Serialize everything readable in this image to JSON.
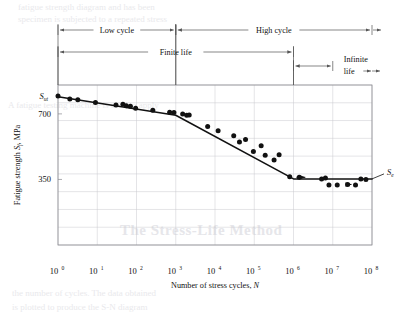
{
  "figure": {
    "caption_symbols": {
      "ultimate_strength": "S",
      "ultimate_strength_sub": "ut",
      "endurance_limit": "S",
      "endurance_limit_sub": "e"
    },
    "axes": {
      "x": {
        "label_text": "Number of stress cycles, ",
        "label_italic": "N",
        "ticks": [
          {
            "mantissa": "10",
            "exponent": "0",
            "value": 1
          },
          {
            "mantissa": "10",
            "exponent": "1",
            "value": 10
          },
          {
            "mantissa": "10",
            "exponent": "2",
            "value": 100
          },
          {
            "mantissa": "10",
            "exponent": "3",
            "value": 1000
          },
          {
            "mantissa": "10",
            "exponent": "4",
            "value": 10000
          },
          {
            "mantissa": "10",
            "exponent": "5",
            "value": 100000
          },
          {
            "mantissa": "10",
            "exponent": "6",
            "value": 1000000
          },
          {
            "mantissa": "10",
            "exponent": "7",
            "value": 10000000
          },
          {
            "mantissa": "10",
            "exponent": "8",
            "value": 100000000
          }
        ],
        "range_log10": [
          0,
          8
        ],
        "scale": "log"
      },
      "y": {
        "label_pre": "Fatigue strength ",
        "label_italic": "S",
        "label_sub": "f",
        "label_post": ", MPa",
        "ticks": [
          {
            "label": "700",
            "value": 700
          },
          {
            "label": "350",
            "value": 350
          }
        ],
        "range": [
          175,
          950
        ],
        "unit": "MPa",
        "scale": "log"
      }
    },
    "annotations": [
      {
        "name": "low-cycle",
        "label": "Low cycle",
        "from_log10": 0,
        "to_log10": 3,
        "row": 0
      },
      {
        "name": "high-cycle",
        "label": "High cycle",
        "from_log10": 3,
        "to_log10": 8,
        "row": 0
      },
      {
        "name": "finite-life",
        "label": "Finite life",
        "from_log10": 0,
        "to_log10": 6,
        "row": 1
      },
      {
        "name": "infinite-life",
        "label": "Infinite",
        "label2": "life",
        "from_log10": 6,
        "to_log10": 8,
        "row": 2
      }
    ],
    "grid": {
      "x_decades": 9,
      "y_lines": 9,
      "visible": true
    }
  },
  "chart_data": {
    "type": "scatter",
    "title": "",
    "xlabel": "Number of stress cycles, N",
    "ylabel": "Fatigue strength Sf, MPa",
    "xscale": "log",
    "yscale": "log",
    "xlim": [
      1,
      100000000
    ],
    "ylim": [
      175,
      950
    ],
    "grid": true,
    "legend": null,
    "series": [
      {
        "name": "S-N fit line",
        "type": "line",
        "points": [
          {
            "x": 1,
            "y": 840
          },
          {
            "x": 1000,
            "y": 690
          },
          {
            "x": 1000000,
            "y": 352
          },
          {
            "x": 100000000,
            "y": 352
          }
        ]
      },
      {
        "name": "Fatigue test data",
        "type": "scatter",
        "points": [
          {
            "x": 1.0,
            "y": 845
          },
          {
            "x": 2.0,
            "y": 820
          },
          {
            "x": 3.2,
            "y": 812
          },
          {
            "x": 9.0,
            "y": 790
          },
          {
            "x": 30,
            "y": 768
          },
          {
            "x": 45,
            "y": 775
          },
          {
            "x": 55,
            "y": 762
          },
          {
            "x": 70,
            "y": 758
          },
          {
            "x": 95,
            "y": 742
          },
          {
            "x": 260,
            "y": 728
          },
          {
            "x": 700,
            "y": 712
          },
          {
            "x": 900,
            "y": 710
          },
          {
            "x": 1500,
            "y": 700
          },
          {
            "x": 1900,
            "y": 690
          },
          {
            "x": 2200,
            "y": 692
          },
          {
            "x": 6500,
            "y": 612
          },
          {
            "x": 12000,
            "y": 586
          },
          {
            "x": 30000,
            "y": 556
          },
          {
            "x": 42000,
            "y": 520
          },
          {
            "x": 60000,
            "y": 534
          },
          {
            "x": 95000,
            "y": 470
          },
          {
            "x": 150000,
            "y": 500
          },
          {
            "x": 190000,
            "y": 452
          },
          {
            "x": 320000,
            "y": 430
          },
          {
            "x": 430000,
            "y": 455
          },
          {
            "x": 800000,
            "y": 360
          },
          {
            "x": 1400000,
            "y": 358
          },
          {
            "x": 5200000,
            "y": 352
          },
          {
            "x": 6500000,
            "y": 355
          },
          {
            "x": 8000000,
            "y": 330
          },
          {
            "x": 13000000,
            "y": 330
          },
          {
            "x": 24000000,
            "y": 332
          },
          {
            "x": 38000000,
            "y": 330
          },
          {
            "x": 52000000,
            "y": 352
          },
          {
            "x": 70000000,
            "y": 350
          }
        ]
      }
    ],
    "markers": [
      {
        "name": "Sut",
        "label": "S_ut",
        "x": 1,
        "y": 845,
        "position": "left"
      },
      {
        "name": "Se",
        "label": "S_e",
        "x": 100000000,
        "y": 352,
        "position": "right"
      }
    ]
  },
  "background_text": {
    "heading": "The Stress-Life Method",
    "lines": [
      "fatigue strength diagram and has been",
      "specimen is subjected to a repeated stress",
      "A fatigue testing machine is used to apply",
      "the number of cycles. The data obtained",
      "is plotted to produce the S-N diagram"
    ]
  }
}
